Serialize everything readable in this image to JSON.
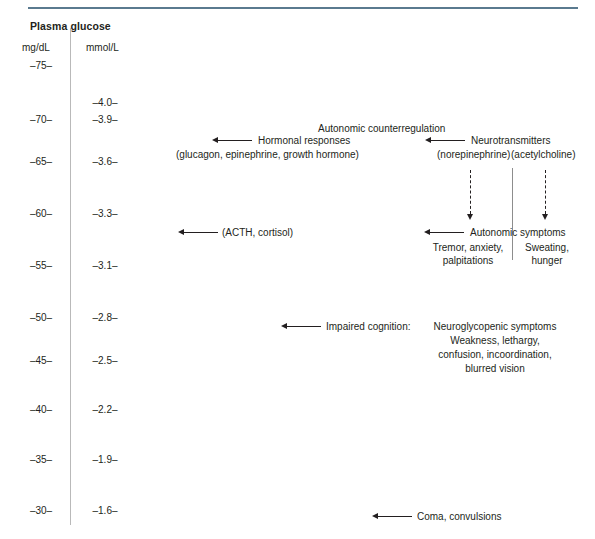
{
  "figure": {
    "title": "Plasma glucose",
    "columns": {
      "left": "mg/dL",
      "right": "mmol/L"
    }
  },
  "chart_data": {
    "type": "table",
    "title": "Plasma glucose",
    "axis_units": [
      "mg/dL",
      "mmol/L"
    ],
    "ticks_mgdl": [
      "–75–",
      "–70–",
      "–65–",
      "–60–",
      "–55–",
      "–50–",
      "–45–",
      "–40–",
      "–35–",
      "–30–"
    ],
    "ticks_mmol": [
      "–4.0–",
      "–3.9–",
      "–3.6–",
      "–3.3–",
      "–3.1–",
      "–2.8–",
      "–2.5–",
      "–2.2–",
      "–1.9–",
      "–1.6–"
    ],
    "mgdl_values": [
      75,
      70,
      65,
      60,
      55,
      50,
      45,
      40,
      35,
      30
    ],
    "mmol_values": [
      4.0,
      3.9,
      3.6,
      3.3,
      3.1,
      2.8,
      2.5,
      2.2,
      1.9,
      1.6
    ],
    "events": [
      {
        "label": "Hormonal responses (glucagon, epinephrine, growth hormone)",
        "mgdl": 68,
        "mmol": 3.8
      },
      {
        "label": "Neurotransmitters (norepinephrine)(acetylcholine)",
        "mgdl": 68,
        "mmol": 3.8
      },
      {
        "label": "(ACTH, cortisol)",
        "mgdl": 60,
        "mmol": 3.3
      },
      {
        "label": "Autonomic symptoms",
        "mgdl": 59,
        "mmol": 3.2
      },
      {
        "label": "Impaired cognition",
        "mgdl": 49,
        "mmol": 2.7
      },
      {
        "label": "Coma, convulsions",
        "mgdl": 30,
        "mmol": 1.6
      }
    ]
  },
  "scale": {
    "mgdl": [
      {
        "label": "–75–",
        "top": 60
      },
      {
        "label": "–70–",
        "top": 114
      },
      {
        "label": "–65–",
        "top": 156
      },
      {
        "label": "–60–",
        "top": 208
      },
      {
        "label": "–55–",
        "top": 260
      },
      {
        "label": "–50–",
        "top": 312
      },
      {
        "label": "–45–",
        "top": 355
      },
      {
        "label": "–40–",
        "top": 404
      },
      {
        "label": "–35–",
        "top": 454
      },
      {
        "label": "–30–",
        "top": 505
      }
    ],
    "mmol": [
      {
        "label": "–4.0–",
        "top": 97
      },
      {
        "label": "–3.9–",
        "top": 114
      },
      {
        "label": "–3.6–",
        "top": 156
      },
      {
        "label": "–3.3–",
        "top": 208
      },
      {
        "label": "–3.1–",
        "top": 260
      },
      {
        "label": "–2.8–",
        "top": 312
      },
      {
        "label": "–2.5–",
        "top": 355
      },
      {
        "label": "–2.2–",
        "top": 404
      },
      {
        "label": "–1.9–",
        "top": 454
      },
      {
        "label": "–1.6–",
        "top": 505
      }
    ]
  },
  "annotations": {
    "counterregulation_heading": "Autonomic counterregulation",
    "hormonal_responses": "Hormonal responses",
    "hormonal_detail": "(glucagon, epinephrine, growth hormone)",
    "neurotransmitters": "Neurotransmitters",
    "neurotransmitter_detail_1": "(norepinephrine)",
    "neurotransmitter_detail_2": "(acetylcholine)",
    "acth": "(ACTH, cortisol)",
    "autonomic_symptoms": "Autonomic symptoms",
    "autonomic_left_1": "Tremor, anxiety,",
    "autonomic_left_2": "palpitations",
    "autonomic_right_1": "Sweating,",
    "autonomic_right_2": "hunger",
    "impaired_cognition": "Impaired cognition:",
    "neuroglycopenic_heading": "Neuroglycopenic symptoms",
    "neuroglycopenic_1": "Weakness, lethargy,",
    "neuroglycopenic_2": "confusion, incoordination,",
    "neuroglycopenic_3": "blurred vision",
    "coma": "Coma, convulsions"
  }
}
